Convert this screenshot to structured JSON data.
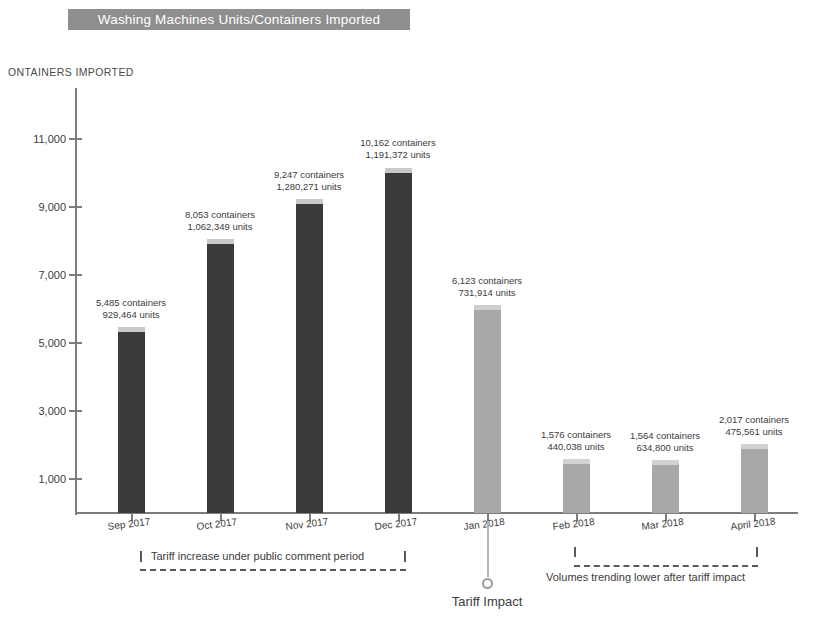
{
  "header": {
    "title": "Washing Machines Units/Containers Imported",
    "bar_color": "#8f8f8f",
    "text_color": "#ffffff"
  },
  "chart_data": {
    "type": "bar",
    "title": "Washing Machines Units/Containers Imported",
    "ylabel": "ONTAINERS IMPORTED",
    "xlabel": "",
    "ylim": [
      0,
      11800
    ],
    "grid": false,
    "legend": "none",
    "categories": [
      "Sep 2017",
      "Oct 2017",
      "Nov 2017",
      "Dec 2017",
      "Jan 2018",
      "Feb 2018",
      "Mar 2018",
      "April 2018"
    ],
    "ytick_labels": [
      "11,000",
      "9,000",
      "7,000",
      "5,000",
      "3,000",
      "1,000"
    ],
    "ytick_values": [
      11000,
      9000,
      7000,
      5000,
      3000,
      1000
    ],
    "values": [
      5485,
      8053,
      9247,
      10162,
      6123,
      1576,
      1564,
      2017
    ],
    "bars": [
      {
        "category": "Sep 2017",
        "containers": 5485,
        "units": 929464,
        "label_containers": "5,485 containers",
        "label_units": "929,464 units",
        "color": "#3a3a3a",
        "cap_color": "#c9c9c9"
      },
      {
        "category": "Oct 2017",
        "containers": 8053,
        "units": 1062349,
        "label_containers": "8,053 containers",
        "label_units": "1,062,349 units",
        "color": "#3a3a3a",
        "cap_color": "#c9c9c9"
      },
      {
        "category": "Nov 2017",
        "containers": 9247,
        "units": 1280271,
        "label_containers": "9,247 containers",
        "label_units": "1,280,271 units",
        "color": "#3a3a3a",
        "cap_color": "#c9c9c9"
      },
      {
        "category": "Dec 2017",
        "containers": 10162,
        "units": 1191372,
        "label_containers": "10,162 containers",
        "label_units": "1,191,372 units",
        "color": "#3a3a3a",
        "cap_color": "#c9c9c9"
      },
      {
        "category": "Jan 2018",
        "containers": 6123,
        "units": 731914,
        "label_containers": "6,123 containers",
        "label_units": "731,914 units",
        "color": "#a8a8a8",
        "cap_color": "#cfcfcf"
      },
      {
        "category": "Feb 2018",
        "containers": 1576,
        "units": 440038,
        "label_containers": "1,576 containers",
        "label_units": "440,038 units",
        "color": "#a8a8a8",
        "cap_color": "#d2d2d2"
      },
      {
        "category": "Mar 2018",
        "containers": 1564,
        "units": 634800,
        "label_containers": "1,564 containers",
        "label_units": "634,800 units",
        "color": "#a8a8a8",
        "cap_color": "#d2d2d2"
      },
      {
        "category": "April 2018",
        "containers": 2017,
        "units": 475561,
        "label_containers": "2,017 containers",
        "label_units": "475,561 units",
        "color": "#a8a8a8",
        "cap_color": "#d2d2d2"
      }
    ],
    "annotations": [
      {
        "id": "tariff-comment-period",
        "text": "Tariff increase under public comment period",
        "spans": [
          "Sep 2017",
          "Dec 2017"
        ]
      },
      {
        "id": "volumes-trending-lower",
        "text": "Volumes trending lower after tariff impact",
        "spans": [
          "Feb 2018",
          "April 2018"
        ]
      },
      {
        "id": "tariff-impact-marker",
        "text": "Tariff Impact",
        "at": "Jan 2018"
      }
    ]
  }
}
